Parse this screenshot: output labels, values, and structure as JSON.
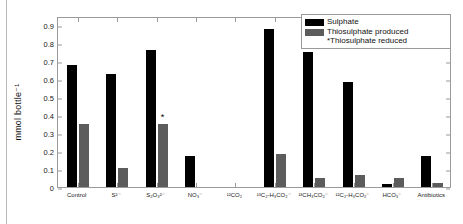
{
  "chart_data": {
    "type": "bar",
    "title": "",
    "xlabel": "",
    "ylabel": "mmol bottle⁻¹",
    "ylim": [
      0,
      0.95
    ],
    "yticks": [
      "0",
      "0.1",
      "0.2",
      "0.3",
      "0.4",
      "0.5",
      "0.6",
      "0.7",
      "0.8",
      "0.9"
    ],
    "ytick_values": [
      0,
      0.1,
      0.2,
      0.3,
      0.4,
      0.5,
      0.6,
      0.7,
      0.8,
      0.9
    ],
    "grid": false,
    "legend_position": "top-right",
    "categories": [
      "Control",
      "S²⁻",
      "S₂O₃²⁻",
      "NO₃⁻",
      "¹²CO₂",
      "¹³C₂-H₃CO₂⁻",
      "¹³CH₃CO₂⁻",
      "¹²C₂-H₃CO₂⁻",
      "HCO₃⁻",
      "Antibiotics"
    ],
    "series": [
      {
        "name": "Sulphate",
        "color": "#000000",
        "values": [
          0.68,
          0.63,
          0.76,
          0.17,
          0.0,
          0.88,
          0.75,
          0.585,
          0.015,
          0.175
        ]
      },
      {
        "name": "Thiosulphate produced",
        "color": "#5c5c5c",
        "values": [
          0.35,
          0.105,
          0.35,
          0.0,
          0.0,
          0.185,
          0.05,
          0.065,
          0.05,
          0.02
        ]
      }
    ],
    "annotations": [
      {
        "text": "*",
        "category": "S₂O₃²⁻",
        "series": "Thiosulphate produced",
        "value": 0.35
      }
    ],
    "legend_entries": [
      "Sulphate",
      "Thiosulphate produced",
      "*Thiosulphate reduced"
    ],
    "legend_note": "*Thiosulphate reduced"
  }
}
